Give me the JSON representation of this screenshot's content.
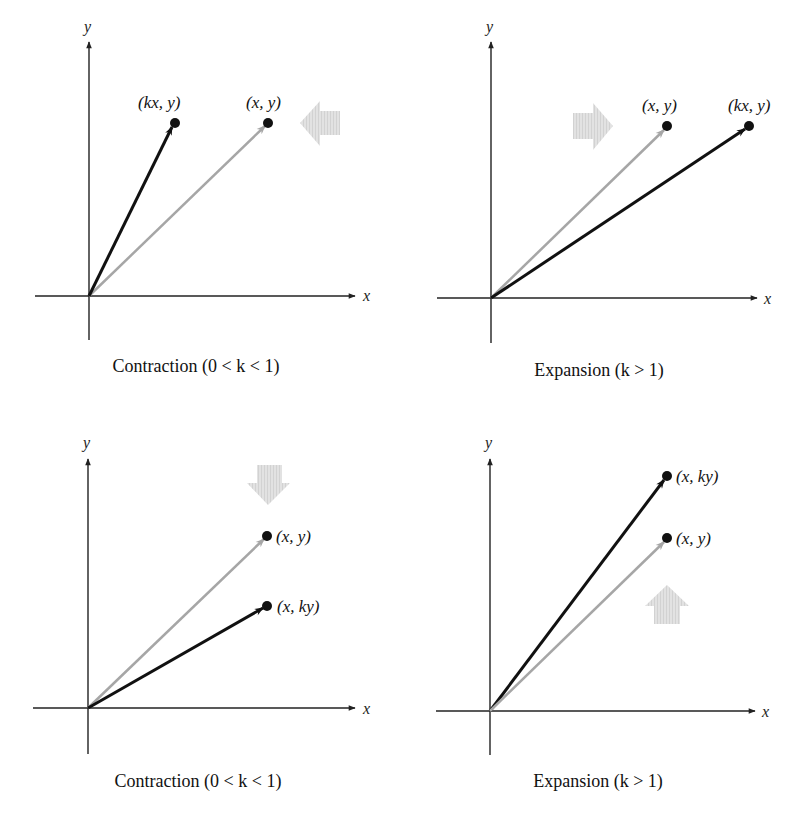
{
  "figure": {
    "colors": {
      "axis": "#222222",
      "original_vector": "#a6a6a6",
      "transformed_vector": "#111111",
      "direction_arrow": "#dcdcdc",
      "point": "#111111"
    },
    "panels": [
      {
        "id": "horizontal-contraction",
        "x_axis_label": "x",
        "y_axis_label": "y",
        "caption": "Contraction (0 < k < 1)",
        "caption_parts": {
          "pre": "Contraction (0 < ",
          "k": "k",
          "post": " < 1)"
        },
        "original_point_label": "(x, y)",
        "transformed_point_label": "(kx, y)",
        "direction": "left"
      },
      {
        "id": "horizontal-expansion",
        "x_axis_label": "x",
        "y_axis_label": "y",
        "caption": "Expansion (k  > 1)",
        "caption_parts": {
          "pre": "Expansion (",
          "k": "k",
          "post": "  > 1)"
        },
        "original_point_label": "(x, y)",
        "transformed_point_label": "(kx, y)",
        "direction": "right"
      },
      {
        "id": "vertical-contraction",
        "x_axis_label": "x",
        "y_axis_label": "y",
        "caption": "Contraction (0 < k < 1)",
        "caption_parts": {
          "pre": "Contraction (0 < ",
          "k": "k",
          "post": " < 1)"
        },
        "original_point_label": "(x, y)",
        "transformed_point_label": "(x, ky)",
        "direction": "down"
      },
      {
        "id": "vertical-expansion",
        "x_axis_label": "x",
        "y_axis_label": "y",
        "caption": "Expansion (k > 1)",
        "caption_parts": {
          "pre": "Expansion (",
          "k": "k",
          "post": " > 1)"
        },
        "original_point_label": "(x, y)",
        "transformed_point_label": "(x, ky)",
        "direction": "up"
      }
    ]
  }
}
